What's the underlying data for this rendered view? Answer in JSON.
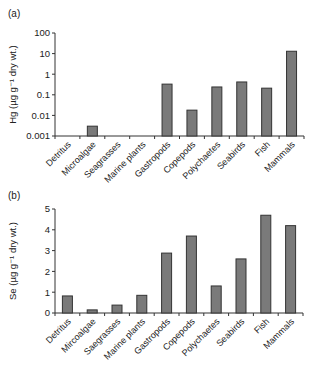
{
  "chart_data": [
    {
      "type": "bar",
      "panel_label": "(a)",
      "title": "",
      "xlabel": "",
      "ylabel": "Hg (µg g⁻¹ dry wt.)",
      "yscale": "log",
      "ylim": [
        0.001,
        100
      ],
      "yticks": [
        "0.001",
        "0.01",
        "0.1",
        "1",
        "10",
        "100"
      ],
      "grid": false,
      "legend": null,
      "categories": [
        "Detritus",
        "Microalgae",
        "Seagrasses",
        "Marine plants",
        "Gastropods",
        "Copepods",
        "Polychaetes",
        "Seabirds",
        "Fish",
        "Mammals"
      ],
      "values": [
        null,
        0.003,
        null,
        null,
        0.33,
        0.018,
        0.24,
        0.42,
        0.21,
        13
      ],
      "bar_color": "#7a7a7a",
      "edge_color": "#333333"
    },
    {
      "type": "bar",
      "panel_label": "(b)",
      "title": "",
      "xlabel": "",
      "ylabel": "Se (µg g⁻¹ dry wt.)",
      "yscale": "linear",
      "ylim": [
        0,
        5
      ],
      "yticks": [
        "0",
        "1",
        "2",
        "3",
        "4",
        "5"
      ],
      "grid": false,
      "legend": null,
      "categories": [
        "Detritus",
        "Mircoalgae",
        "Saegrasses",
        "Marine plants",
        "Gastropods",
        "Copepods",
        "Polychaetes",
        "Seabirds",
        "Fish",
        "Mammals"
      ],
      "values": [
        0.82,
        0.15,
        0.38,
        0.85,
        2.88,
        3.7,
        1.3,
        2.6,
        4.7,
        4.2
      ],
      "bar_color": "#7a7a7a",
      "edge_color": "#333333"
    }
  ]
}
